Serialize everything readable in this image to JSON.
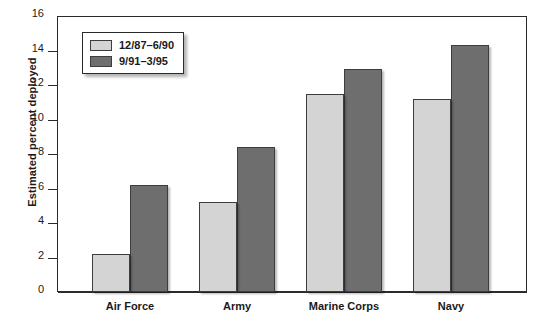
{
  "chart_data": {
    "type": "bar",
    "title": "",
    "xlabel": "",
    "ylabel": "Estimated percent deployed",
    "categories": [
      "Air Force",
      "Army",
      "Marine Corps",
      "Navy"
    ],
    "series": [
      {
        "name": "12/87–6/90",
        "color": "#d4d4d4",
        "values": [
          2.2,
          5.2,
          11.5,
          11.2
        ]
      },
      {
        "name": "9/91–3/95",
        "color": "#6e6e6e",
        "values": [
          6.2,
          8.4,
          12.9,
          14.3
        ]
      }
    ],
    "ylim": [
      0,
      16
    ],
    "yticks": [
      0,
      2,
      4,
      6,
      8,
      10,
      12,
      14,
      16
    ],
    "ytick_labels": [
      "0",
      "2",
      "4",
      "6",
      "8",
      "10",
      "12",
      "14",
      "16"
    ],
    "grid": false,
    "legend_position": "top-left"
  },
  "legend": {
    "items": [
      {
        "label": "12/87–6/90",
        "color": "#d4d4d4"
      },
      {
        "label": "9/91–3/95",
        "color": "#6e6e6e"
      }
    ]
  },
  "axis": {
    "y_title": "Estimated percent deployed"
  }
}
